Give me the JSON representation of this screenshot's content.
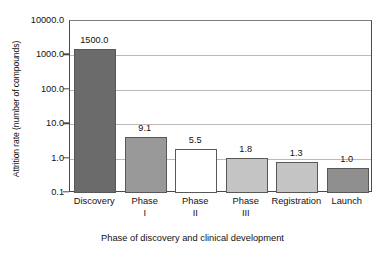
{
  "chart_data": {
    "type": "bar",
    "title": "",
    "xlabel": "Phase of discovery and clinical development",
    "ylabel": "Attrition rate (number of compounds)",
    "yscale": "log",
    "ylim": [
      0.1,
      10000.0
    ],
    "grid": true,
    "legend": "none",
    "categories": [
      "Discovery",
      "Phase I",
      "Phase II",
      "Phase III",
      "Registration",
      "Launch"
    ],
    "category_lines": [
      {
        "line1": "Discovery",
        "line2": ""
      },
      {
        "line1": "Phase",
        "line2": "I"
      },
      {
        "line1": "Phase",
        "line2": "II"
      },
      {
        "line1": "Phase",
        "line2": "III"
      },
      {
        "line1": "Registration",
        "line2": ""
      },
      {
        "line1": "Launch",
        "line2": ""
      }
    ],
    "values": [
      1500.0,
      9.1,
      5.5,
      1.8,
      1.3,
      1.0
    ],
    "value_labels": [
      "1500.0",
      "9.1",
      "5.5",
      "1.8",
      "1.3",
      "1.0"
    ],
    "bar_drawn_values": [
      1500.0,
      4.2,
      1.9,
      1.05,
      0.82,
      0.55
    ],
    "bar_colors": [
      "#6b6b6b",
      "#999999",
      "#ffffff",
      "#c4c4c4",
      "#c4c4c4",
      "#8f8f8f"
    ],
    "bar_edge_color": "#585858",
    "yticks": [
      0.1,
      1.0,
      10.0,
      100.0,
      1000.0,
      10000.0
    ],
    "ytick_labels": [
      "0.1",
      "1.0",
      "10.0",
      "100.0",
      "1000.0",
      "10000.0"
    ],
    "gridline_color": "#b9b9b9",
    "axis_color": "#4a4a4a",
    "background": "#ffffff"
  }
}
